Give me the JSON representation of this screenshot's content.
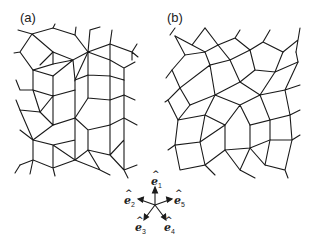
{
  "figure": {
    "panels": [
      {
        "label": "(a)",
        "description": "rhombus tiling (ordered)"
      },
      {
        "label": "(b)",
        "description": "rhombus tiling (randomized)"
      }
    ],
    "basis_vectors": [
      {
        "name": "e",
        "sub": "1",
        "angle_deg": 90
      },
      {
        "name": "e",
        "sub": "2",
        "angle_deg": 162
      },
      {
        "name": "e",
        "sub": "3",
        "angle_deg": 234
      },
      {
        "name": "e",
        "sub": "4",
        "angle_deg": 306
      },
      {
        "name": "e",
        "sub": "5",
        "angle_deg": 18
      }
    ],
    "hat": "^"
  }
}
